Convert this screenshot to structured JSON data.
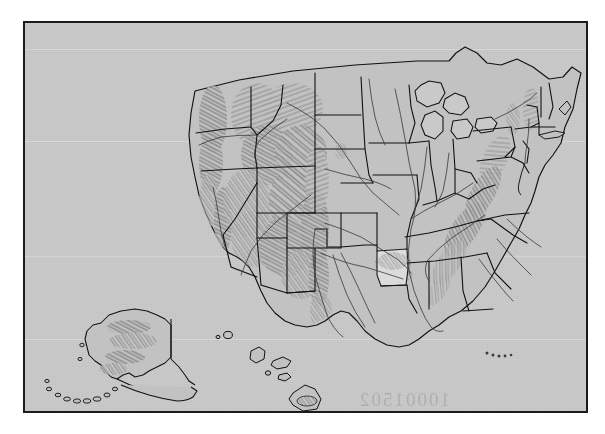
{
  "image": {
    "kind": "scanned-map-plate",
    "width": 605,
    "height": 434,
    "outer_background": "#ffffff",
    "plate_background": "#c9c9c9",
    "frame_color": "#1b1b1b"
  },
  "map": {
    "title": "United States shaded relief map",
    "projection_note": "Conterminous United States with Alaska and Hawaii insets",
    "style": "grayscale shaded relief with state boundaries and major rivers",
    "line_color": "#111111",
    "relief_color": "#555555",
    "land_fill": "#c2c2c2",
    "highlight_fill": "#dedede",
    "highlighted_state": "Arkansas",
    "insets": [
      {
        "name": "Alaska",
        "position": "lower-left"
      },
      {
        "name": "Hawaii",
        "position": "lower-center"
      }
    ],
    "features": [
      "state-boundaries",
      "coastline",
      "major-rivers",
      "great-lakes",
      "shaded-relief-hillshade",
      "aleutian-islands",
      "florida-keys"
    ]
  },
  "watermark": {
    "text": "10001502",
    "note": "faint mirrored scanner text near bottom of plate"
  }
}
